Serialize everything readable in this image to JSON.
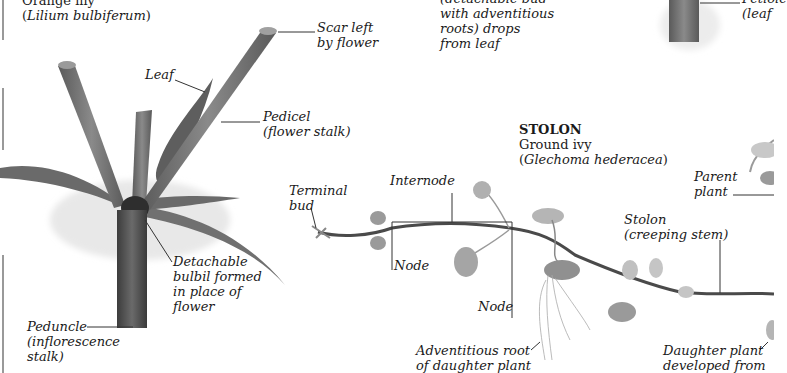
{
  "left_panel": {
    "common_name": "Orange lily",
    "latin_open": "(",
    "latin_name": "Lilium bulbiferum",
    "latin_close": ")",
    "labels": {
      "leaf": "Leaf",
      "scar": "Scar left\nby flower",
      "pedicel": "Pedicel\n(flower stalk)",
      "bulbil": "Detachable\nbulbil formed\nin place of\nflower",
      "peduncle": "Peduncle\n(inflorescence\nstalk)"
    }
  },
  "top_middle": {
    "text": "(detachable bud\nwith adventitious\nroots) drops\nfrom leaf"
  },
  "top_right": {
    "label_line1": "Petiole",
    "label_line2": "(leaf"
  },
  "stolon_panel": {
    "heading": "STOLON",
    "common_name": "Ground ivy",
    "latin_open": "(",
    "latin_name": "Glechoma hederacea",
    "latin_close": ")",
    "labels": {
      "terminal_bud": "Terminal\nbud",
      "internode": "Internode",
      "node_1": "Node",
      "node_2": "Node",
      "stolon": "Stolon\n(creeping stem)",
      "parent_plant": "Parent\nplant",
      "adventitious_root": "Adventitious root\nof daughter plant",
      "daughter_plant": "Daughter plant\ndeveloped from"
    }
  },
  "colors": {
    "stem_dark": "#4a4a4a",
    "stem_mid": "#6e6e6e",
    "leaf_light": "#9a9a9a",
    "leader_line": "#333333",
    "background": "#ffffff"
  }
}
